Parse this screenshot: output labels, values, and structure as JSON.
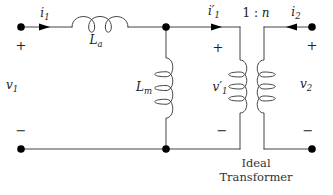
{
  "diagram": {
    "type": "circuit-schematic",
    "line_color": "#444444",
    "node_color": "#000000",
    "background": "#ffffff"
  },
  "labels": {
    "i1": {
      "base": "i",
      "sub": "1"
    },
    "la": {
      "base": "L",
      "sub": "a"
    },
    "i1p": {
      "base": "i′",
      "sub": "1"
    },
    "ratio": {
      "prefix": "1 : ",
      "n": "n"
    },
    "i2": {
      "base": "i",
      "sub": "2"
    },
    "v1": {
      "base": "v",
      "sub": "1"
    },
    "lm": {
      "base": "L",
      "sub": "m"
    },
    "v1p": {
      "base": "v′",
      "sub": "1"
    },
    "v2": {
      "base": "v",
      "sub": "2"
    },
    "plus": "+",
    "minus": "−",
    "caption_line1": "Ideal",
    "caption_line2": "Transformer"
  }
}
